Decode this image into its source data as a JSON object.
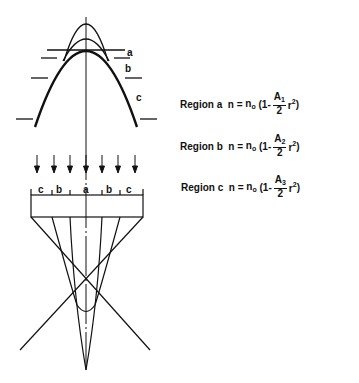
{
  "profile_labels": {
    "a": "a",
    "b": "b",
    "c": "c"
  },
  "lens_labels": [
    "c",
    "b",
    "a",
    "b",
    "c"
  ],
  "equations": [
    {
      "region": "Region a",
      "n": "n",
      "eq": "=",
      "n0": "n",
      "n0_sub": "o",
      "open": "(1-",
      "A": "A",
      "A_sub": "1",
      "den": "2",
      "r": "r",
      "r_sup": "2",
      "close": ")"
    },
    {
      "region": "Region b",
      "n": "n",
      "eq": "=",
      "n0": "n",
      "n0_sub": "o",
      "open": "(1-",
      "A": "A",
      "A_sub": "2",
      "den": "2",
      "r": "r",
      "r_sup": "2",
      "close": ")"
    },
    {
      "region": "Region c",
      "n": "n",
      "eq": "=",
      "n0": "n",
      "n0_sub": "o",
      "open": "(1-",
      "A": "A",
      "A_sub": "3",
      "den": "2",
      "r": "r",
      "r_sup": "2",
      "close": ")"
    }
  ],
  "colors": {
    "line": "#111111",
    "background": "#ffffff"
  }
}
